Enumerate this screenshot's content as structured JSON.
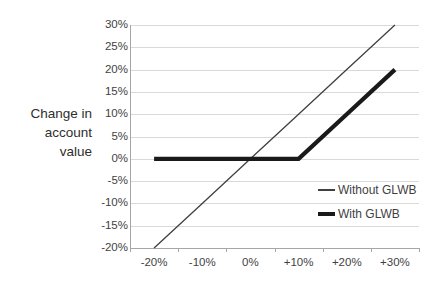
{
  "chart_data": {
    "type": "line",
    "title": "",
    "xlabel": "",
    "ylabel": "Change in\naccount\nvalue",
    "categories": [
      "-20%",
      "-10%",
      "0%",
      "+10%",
      "+20%",
      "+30%"
    ],
    "x_tick_labels": [
      "-20%",
      "-10%",
      "0%",
      "+10%",
      "+20%",
      "+30%"
    ],
    "y_tick_labels": [
      "30%",
      "25%",
      "20%",
      "15%",
      "10%",
      "5%",
      "0%",
      "-5%",
      "-10%",
      "-15%",
      "-20%"
    ],
    "y_tick_values": [
      30,
      25,
      20,
      15,
      10,
      5,
      0,
      -5,
      -10,
      -15,
      -20
    ],
    "ylim": [
      -20,
      30
    ],
    "grid": true,
    "legend_position": "right-middle",
    "series": [
      {
        "name": "Without GLWB",
        "style": "thin",
        "color": "#404040",
        "values": [
          -20,
          -10,
          0,
          10,
          20,
          30
        ]
      },
      {
        "name": "With GLWB",
        "style": "thick",
        "color": "#1a1a1a",
        "values": [
          0,
          0,
          0,
          0,
          10,
          20
        ]
      }
    ]
  },
  "legend": {
    "items": [
      {
        "label": "Without GLWB"
      },
      {
        "label": "With GLWB"
      }
    ]
  },
  "axes": {
    "y_title": "Change in\naccount\nvalue"
  }
}
